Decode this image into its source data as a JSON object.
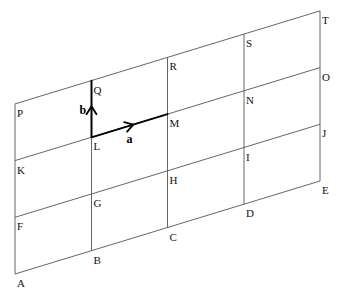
{
  "diagram": {
    "type": "parallelogram grid (vectors)",
    "grid": {
      "columns": 5,
      "rows": 4,
      "column_x": [
        15,
        91.5,
        167.5,
        244,
        320
      ],
      "base_y_at_left": 274,
      "row_step": 56.7,
      "column_slope": -23.25
    },
    "points": [
      {
        "name": "A",
        "col": 0,
        "row": 0
      },
      {
        "name": "B",
        "col": 1,
        "row": 0
      },
      {
        "name": "C",
        "col": 2,
        "row": 0
      },
      {
        "name": "D",
        "col": 3,
        "row": 0
      },
      {
        "name": "E",
        "col": 4,
        "row": 0
      },
      {
        "name": "F",
        "col": 0,
        "row": 1
      },
      {
        "name": "G",
        "col": 1,
        "row": 1
      },
      {
        "name": "H",
        "col": 2,
        "row": 1
      },
      {
        "name": "I",
        "col": 3,
        "row": 1
      },
      {
        "name": "J",
        "col": 4,
        "row": 1
      },
      {
        "name": "K",
        "col": 0,
        "row": 2
      },
      {
        "name": "L",
        "col": 1,
        "row": 2
      },
      {
        "name": "M",
        "col": 2,
        "row": 2
      },
      {
        "name": "N",
        "col": 3,
        "row": 2
      },
      {
        "name": "O",
        "col": 4,
        "row": 2
      },
      {
        "name": "P",
        "col": 0,
        "row": 3
      },
      {
        "name": "Q",
        "col": 1,
        "row": 3
      },
      {
        "name": "R",
        "col": 2,
        "row": 3
      },
      {
        "name": "S",
        "col": 3,
        "row": 3
      },
      {
        "name": "T",
        "col": 4,
        "row": 3
      }
    ],
    "vectors": [
      {
        "label": "a",
        "from": "L",
        "to": "M"
      },
      {
        "label": "b",
        "from": "L",
        "to": "Q"
      }
    ],
    "colors": {
      "grid": "#555555",
      "vector": "#000000",
      "background": "#ffffff"
    }
  }
}
